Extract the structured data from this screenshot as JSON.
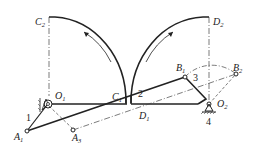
{
  "diagram": {
    "type": "mechanism-linkage",
    "points": {
      "C2": {
        "label": "C",
        "sub": "2"
      },
      "D2": {
        "label": "D",
        "sub": "2"
      },
      "C1": {
        "label": "C",
        "sub": "1"
      },
      "D1": {
        "label": "D",
        "sub": "1"
      },
      "B1": {
        "label": "B",
        "sub": "1"
      },
      "B2": {
        "label": "B",
        "sub": "2"
      },
      "O1": {
        "label": "O",
        "sub": "1"
      },
      "O2": {
        "label": "O",
        "sub": "2"
      },
      "A1": {
        "label": "A",
        "sub": "1"
      },
      "A3": {
        "label": "A",
        "sub": "3"
      }
    },
    "links": {
      "link1": "1",
      "link2": "2",
      "link3": "3",
      "link4": "4"
    },
    "colors": {
      "stroke": "#222222",
      "background": "#ffffff"
    }
  }
}
